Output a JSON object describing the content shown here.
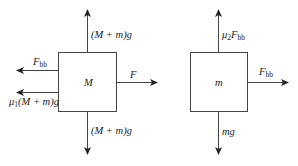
{
  "diagram": {
    "type": "free-body diagrams",
    "left_block": {
      "label": "M",
      "forces": {
        "up": {
          "label": "(M + m)g"
        },
        "down": {
          "label": "(M + m)g"
        },
        "right": {
          "label": "F"
        },
        "left_top": {
          "base": "F",
          "sub": "bb"
        },
        "left_bottom": {
          "prefix": "μ",
          "sub": "1",
          "suffix": "(M + m)g"
        }
      }
    },
    "right_block": {
      "label": "m",
      "forces": {
        "up": {
          "prefix": "μ",
          "sub": "2",
          "base": "F",
          "sub2": "bb"
        },
        "down": {
          "label": "mg"
        },
        "right": {
          "base": "F",
          "sub": "bb"
        }
      }
    },
    "colors": {
      "line": "#333333",
      "text": "#222222"
    }
  }
}
